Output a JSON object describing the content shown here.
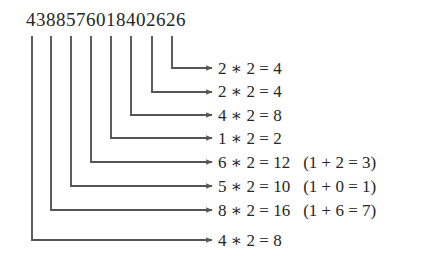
{
  "diagram": {
    "type": "luhn-algorithm-doubling-diagram",
    "number": "4388576018402626",
    "digit_count": 16,
    "colors": {
      "background": "#ffffff",
      "text": "#262626",
      "line": "#555555"
    },
    "rows": [
      {
        "digit": "2",
        "multiplier": "2",
        "product": "4",
        "main": "2 ∗ 2 = 4",
        "note": ""
      },
      {
        "digit": "2",
        "multiplier": "2",
        "product": "4",
        "main": "2 ∗ 2 = 4",
        "note": ""
      },
      {
        "digit": "4",
        "multiplier": "2",
        "product": "8",
        "main": "4 ∗ 2 = 8",
        "note": ""
      },
      {
        "digit": "1",
        "multiplier": "2",
        "product": "2",
        "main": "1 ∗ 2 = 2",
        "note": ""
      },
      {
        "digit": "6",
        "multiplier": "2",
        "product": "12",
        "main": "6 ∗ 2 = 12",
        "note": "(1 + 2 = 3)"
      },
      {
        "digit": "5",
        "multiplier": "2",
        "product": "10",
        "main": "5 ∗ 2 = 10",
        "note": "(1 + 0 = 1)"
      },
      {
        "digit": "8",
        "multiplier": "2",
        "product": "16",
        "main": "8 ∗ 2 = 16",
        "note": "(1 + 6 = 7)"
      },
      {
        "digit": "4",
        "multiplier": "2",
        "product": "8",
        "main": "4 ∗ 2 = 8",
        "note": ""
      }
    ],
    "connectors": [
      {
        "index": 0,
        "source_digit_index": 14,
        "x": 172,
        "y": 68,
        "label": "connector-to-row-1"
      },
      {
        "index": 1,
        "source_digit_index": 12,
        "x": 152,
        "y": 92,
        "label": "connector-to-row-2"
      },
      {
        "index": 2,
        "source_digit_index": 10,
        "x": 131,
        "y": 115,
        "label": "connector-to-row-3"
      },
      {
        "index": 3,
        "source_digit_index": 8,
        "x": 111,
        "y": 138,
        "label": "connector-to-row-4"
      },
      {
        "index": 4,
        "source_digit_index": 6,
        "x": 91,
        "y": 162,
        "label": "connector-to-row-5"
      },
      {
        "index": 5,
        "source_digit_index": 4,
        "x": 71,
        "y": 186,
        "label": "connector-to-row-6"
      },
      {
        "index": 6,
        "source_digit_index": 2,
        "x": 51,
        "y": 210,
        "label": "connector-to-row-7"
      },
      {
        "index": 7,
        "source_digit_index": 0,
        "x": 32,
        "y": 240,
        "label": "connector-to-row-8"
      }
    ],
    "arrow_end_x": 212,
    "lines_top_y": 36
  }
}
